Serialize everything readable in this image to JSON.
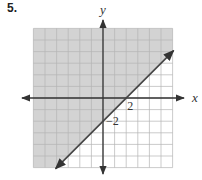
{
  "problem": {
    "number": "5."
  },
  "chart_data": {
    "type": "line",
    "title": "",
    "xlabel": "x",
    "ylabel": "y",
    "xlim": [
      -6,
      6
    ],
    "ylim": [
      -6,
      6
    ],
    "grid": true,
    "tick_labels": {
      "x": [
        "2"
      ],
      "y": [
        "−2"
      ]
    },
    "series": [
      {
        "name": "boundary line y = x - 2",
        "style": "solid",
        "points": [
          [
            -4,
            -6
          ],
          [
            6,
            4
          ]
        ],
        "slope": 1,
        "intercept": -2,
        "arrows": "both"
      }
    ],
    "shaded_region": {
      "inequality": "y >= x - 2",
      "side": "above",
      "color": "#cfcfcf"
    }
  },
  "colors": {
    "shade": "#d3d3d3",
    "grid": "#b5b5b5",
    "axis": "#333333",
    "line": "#444444"
  }
}
